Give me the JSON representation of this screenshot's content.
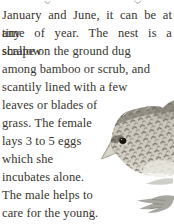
{
  "page": {
    "bg_color": "#ffffff",
    "text_color": "#37342d"
  },
  "paragraph": {
    "lines": [
      "January and June, it can be at any",
      "time of year. The nest is a shallow",
      "scrape on the ground dug",
      "among bamboo or scrub, and",
      "scantily lined with a few",
      "leaves or blades of",
      "grass. The female",
      "lays 3 to 5 eggs",
      "which she",
      "incubates alone.",
      "The male helps to",
      "care for the young."
    ]
  },
  "illustration": {
    "alt": "Painted head of a buttonquail facing left: mottled grey-brown plumage with dark chevron speckles, dark eye with pale eye-ring, pale pointed beak; faint grey sketches of the bird's feet below the head",
    "plumage_light": "#d2cec4",
    "plumage_dark": "#57534a",
    "crown_color": "#6e6a60",
    "eye_color": "#17140f",
    "beak_color": "#d9d5c8",
    "feet_color": "#9d9d96"
  },
  "fragments": {
    "top_clipped_line": "descender tips of a cropped previous text line",
    "left_edge_mark": "faint small mark near left of foot sketch"
  }
}
